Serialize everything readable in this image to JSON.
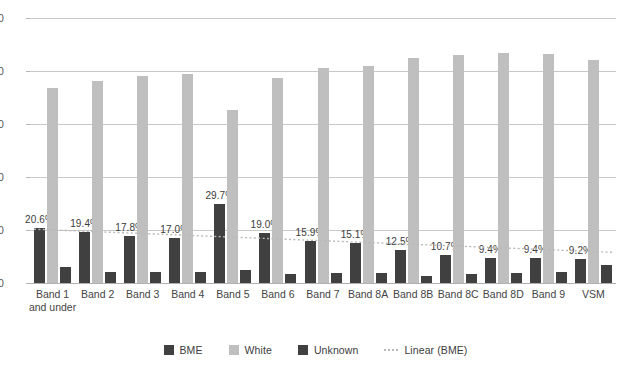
{
  "chart_data": {
    "type": "bar",
    "title": "",
    "subtitle": "",
    "xlabel": "",
    "ylabel": "",
    "ylim": [
      0,
      100
    ],
    "yticks": [
      0,
      20,
      40,
      60,
      80,
      100
    ],
    "grid": true,
    "legend_position": "bottom",
    "categories": [
      "Band 1\nand under",
      "Band 2",
      "Band 3",
      "Band 4",
      "Band 5",
      "Band 6",
      "Band 7",
      "Band 8A",
      "Band 8B",
      "Band 8C",
      "Band 8D",
      "Band 9",
      "VSM"
    ],
    "series": [
      {
        "name": "BME",
        "color": "#404040",
        "values": [
          20.6,
          19.4,
          17.8,
          17.0,
          29.7,
          19.0,
          15.9,
          15.1,
          12.5,
          10.7,
          9.4,
          9.4,
          9.2
        ],
        "labels": [
          "20.6%",
          "19.4%",
          "17.8%",
          "17.0%",
          "29.7%",
          "19.0%",
          "15.9%",
          "15.1%",
          "12.5%",
          "10.7%",
          "9.4%",
          "9.4%",
          "9.2%"
        ]
      },
      {
        "name": "White",
        "color": "#bfbfbf",
        "values": [
          73.5,
          76.4,
          78.2,
          78.7,
          65.3,
          77.5,
          81.2,
          82.0,
          84.8,
          86.0,
          86.8,
          86.5,
          84.0
        ],
        "labels": []
      },
      {
        "name": "Unknown",
        "color": "#404040",
        "values": [
          5.9,
          4.2,
          4.0,
          4.3,
          5.0,
          3.5,
          3.9,
          3.8,
          2.7,
          3.3,
          3.8,
          4.1,
          6.8
        ],
        "labels": []
      }
    ],
    "trendline": {
      "name": "Linear (BME)",
      "color": "#b9b9b9",
      "style": "dotted",
      "start_value": 20.3,
      "end_value": 11.6
    }
  },
  "legend": {
    "items": [
      {
        "label": "BME",
        "type": "swatch",
        "color": "#404040"
      },
      {
        "label": "White",
        "type": "swatch",
        "color": "#bfbfbf"
      },
      {
        "label": "Unknown",
        "type": "swatch",
        "color": "#404040"
      },
      {
        "label": "Linear (BME)",
        "type": "line",
        "color": "#b9b9b9"
      }
    ]
  }
}
